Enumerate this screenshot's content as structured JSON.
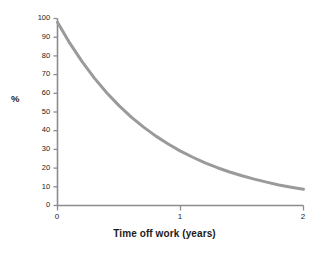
{
  "chart_data": {
    "type": "line",
    "title": "",
    "subtitle": "",
    "xlabel": "Time off work (years)",
    "ylabel": "%",
    "xlim": [
      0,
      2
    ],
    "ylim": [
      0,
      100
    ],
    "xticks": [
      "0",
      "1",
      "2"
    ],
    "xtick_values": [
      0,
      1,
      2
    ],
    "yticks": [
      "0",
      "10",
      "20",
      "30",
      "40",
      "50",
      "60",
      "70",
      "80",
      "90",
      "100"
    ],
    "ytick_values": [
      0,
      10,
      20,
      30,
      40,
      50,
      60,
      70,
      80,
      90,
      100
    ],
    "grid": false,
    "legend": "none",
    "series": [
      {
        "name": "Probability of return to work",
        "color": "#9a9a9a",
        "line_width": 3,
        "x": [
          0,
          0.1,
          0.2,
          0.3,
          0.4,
          0.5,
          0.6,
          0.7,
          0.8,
          0.9,
          1.0,
          1.1,
          1.2,
          1.3,
          1.4,
          1.5,
          1.6,
          1.7,
          1.8,
          1.9,
          2.0
        ],
        "values": [
          98,
          86.8,
          76.9,
          68.1,
          60.3,
          53.4,
          47.3,
          41.9,
          37.1,
          32.9,
          29.1,
          25.8,
          22.8,
          20.2,
          17.9,
          15.9,
          14.1,
          12.5,
          11.0,
          9.8,
          8.7
        ]
      }
    ],
    "annotations": []
  },
  "axes": {
    "axis_color": "#8c8c8c",
    "tick_label_color": "#1b1b1b",
    "background": "#ffffff"
  }
}
